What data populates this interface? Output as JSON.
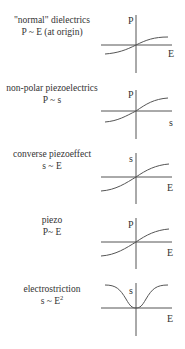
{
  "panels": [
    {
      "title": "\"normal\" dielectrics",
      "relation": "P ~ E (at origin)",
      "y_axis_label": "P",
      "x_axis_label": "E",
      "curve_type": "sigmoid-through-origin"
    },
    {
      "title": "non-polar piezoelectrics",
      "relation": "P ~ s",
      "y_axis_label": "P",
      "x_axis_label": "s",
      "curve_type": "sigmoid-through-origin"
    },
    {
      "title": "converse piezoeffect",
      "relation": "s ~ E",
      "y_axis_label": "s",
      "x_axis_label": "E",
      "curve_type": "sigmoid-through-origin"
    },
    {
      "title": "piezo",
      "relation": "P~ E",
      "y_axis_label": "P",
      "x_axis_label": "E",
      "curve_type": "sigmoid-through-origin"
    },
    {
      "title": "electrostriction",
      "relation": "s ~ E",
      "relation_superscript": "2",
      "y_axis_label": "s",
      "x_axis_label": "E",
      "curve_type": "inverted-bell (quadratic, saturating)"
    }
  ]
}
